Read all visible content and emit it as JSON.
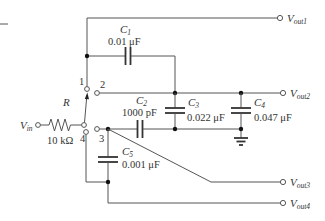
{
  "diagram": {
    "type": "circuit-schematic",
    "input": {
      "label": "V",
      "sub": "in"
    },
    "resistor": {
      "name": "R",
      "value": "10 kΩ"
    },
    "switch": {
      "positions": [
        "1",
        "2",
        "3",
        "4"
      ],
      "selected": "1"
    },
    "capacitors": [
      {
        "name": "C",
        "sub": "1",
        "value": "0.01 μF"
      },
      {
        "name": "C",
        "sub": "2",
        "value": "1000 pF"
      },
      {
        "name": "C",
        "sub": "3",
        "value": "0.022 μF"
      },
      {
        "name": "C",
        "sub": "4",
        "value": "0.047 μF"
      },
      {
        "name": "C",
        "sub": "5",
        "value": "0.001 μF"
      }
    ],
    "outputs": [
      {
        "label": "V",
        "sub": "out1"
      },
      {
        "label": "V",
        "sub": "out2"
      },
      {
        "label": "V",
        "sub": "out3"
      },
      {
        "label": "V",
        "sub": "out4"
      }
    ],
    "ground": "ground-symbol"
  }
}
